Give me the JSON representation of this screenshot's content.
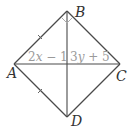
{
  "diagram": {
    "type": "quadrilateral-with-diagonals",
    "vertices": {
      "A": {
        "label": "A",
        "x": 14,
        "y": 64
      },
      "B": {
        "label": "B",
        "x": 67,
        "y": 11
      },
      "C": {
        "label": "C",
        "x": 120,
        "y": 64
      },
      "D": {
        "label": "D",
        "x": 67,
        "y": 117
      }
    },
    "sides": [
      "AB",
      "BC",
      "CD",
      "DA"
    ],
    "diagonals": [
      "AC",
      "BD"
    ],
    "right_angle_at": "B",
    "tick_marks_on": [
      "AB",
      "AD"
    ],
    "segment_labels": {
      "left_half_AC": {
        "coef": "2",
        "var": "x",
        "rest": " − 1"
      },
      "right_half_AC": {
        "coef": "3",
        "var": "y",
        "rest": " + 5"
      }
    },
    "colors": {
      "line": "#4a4a4a",
      "vertex_label": "#333333",
      "segment_label": "#9a9a9a",
      "right_angle_mark": "#aaaaaa"
    }
  }
}
